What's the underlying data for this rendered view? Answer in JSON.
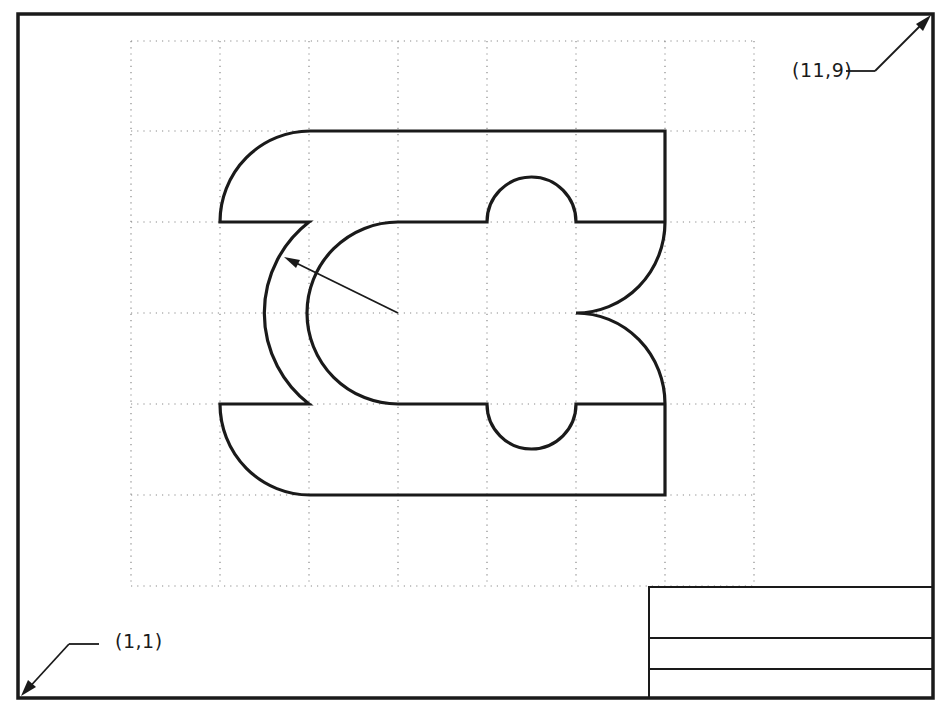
{
  "drawing": {
    "type": "technical drawing exercise on dotted grid",
    "corner_labels": {
      "top_right": "(11,9)",
      "bottom_left": "(1,1)"
    },
    "grid": {
      "columns": 7,
      "rows": 6,
      "style": "dotted"
    },
    "title_block": {
      "rows": 3
    },
    "colors": {
      "line": "#1a1a1a",
      "grid": "#8a8a8a",
      "background": "#ffffff"
    }
  }
}
